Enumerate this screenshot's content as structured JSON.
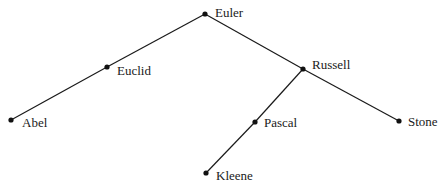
{
  "diagram": {
    "type": "binary-tree",
    "nodes": [
      {
        "id": "euler",
        "label": "Euler",
        "x": 205,
        "y": 14
      },
      {
        "id": "euclid",
        "label": "Euclid",
        "x": 107,
        "y": 67
      },
      {
        "id": "abel",
        "label": "Abel",
        "x": 11,
        "y": 120
      },
      {
        "id": "russell",
        "label": "Russell",
        "x": 303,
        "y": 69
      },
      {
        "id": "pascal",
        "label": "Pascal",
        "x": 255,
        "y": 122
      },
      {
        "id": "kleene",
        "label": "Kleene",
        "x": 206,
        "y": 173
      },
      {
        "id": "stone",
        "label": "Stone",
        "x": 399,
        "y": 121
      }
    ],
    "edges": [
      [
        "euler",
        "euclid"
      ],
      [
        "euclid",
        "abel"
      ],
      [
        "euler",
        "russell"
      ],
      [
        "russell",
        "pascal"
      ],
      [
        "pascal",
        "kleene"
      ],
      [
        "russell",
        "stone"
      ]
    ]
  }
}
